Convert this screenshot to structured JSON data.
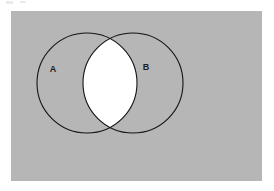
{
  "figure": {
    "type": "venn-diagram",
    "title": "",
    "panel": {
      "background_color": "#b6b6b6",
      "outer_background_color": "#ffffff",
      "x": 11,
      "y": 11,
      "width": 251,
      "height": 170
    },
    "sets": [
      {
        "id": "A",
        "label": "A",
        "label_x": 53,
        "label_y": 70,
        "center_x": 87,
        "center_y": 83,
        "radius": 50,
        "fill_color": "#b6b6b6",
        "stroke_color": "#141414"
      },
      {
        "id": "B",
        "label": "B",
        "label_x": 146,
        "label_y": 68,
        "center_x": 133,
        "center_y": 83,
        "radius": 50,
        "fill_color": "#b6b6b6",
        "stroke_color": "#141414"
      }
    ],
    "intersection": {
      "label": "",
      "highlighted": true,
      "fill_color": "#ffffff",
      "description": "A intersect B"
    }
  }
}
